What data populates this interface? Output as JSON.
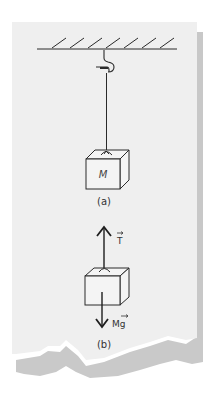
{
  "figure": {
    "colors": {
      "background": "#ffffff",
      "card": "#efefef",
      "card_shadow": "#c6c6c6",
      "ink": "#2a2a2a"
    },
    "panel_a": {
      "mass_label": "M",
      "caption": "(a)"
    },
    "panel_b": {
      "tension_label": "T",
      "weight_label": "Mg",
      "caption": "(b)"
    }
  }
}
